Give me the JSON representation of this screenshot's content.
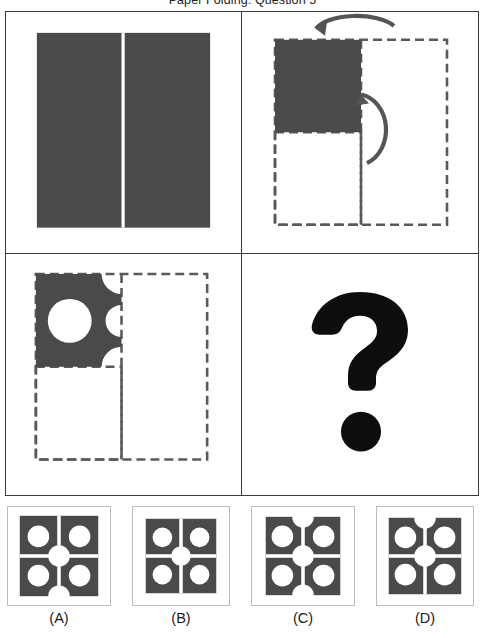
{
  "title": "Paper Folding: Question 5",
  "colors": {
    "paper_dark": "#4a4a4a",
    "paper_dark_alt": "#444444",
    "ink_black": "#0d0d0d",
    "fold_line": "#ffffff",
    "dashed_outline": "#5a5a5a",
    "panel_border": "#3b3b3b",
    "answer_border": "#bdbdbd",
    "background": "#ffffff"
  },
  "panels": [
    {
      "index": 1,
      "name": "unfolded-sheet",
      "description": "Full dark square sheet with a single vertical fold line down the centre",
      "fold_lines": 1,
      "fold_orientation": "vertical",
      "holes": 0
    },
    {
      "index": 2,
      "name": "folding-step",
      "description": "Sheet folded right-half over to the left, then bottom-half up; dark quadrant top-left, dashed outlines show original extents",
      "shaded_quadrant": "top-left",
      "arrows": [
        {
          "name": "fold-arrow-horizontal",
          "from": "right",
          "to": "left",
          "position": "top"
        },
        {
          "name": "fold-arrow-vertical",
          "from": "bottom",
          "to": "top",
          "position": "right"
        }
      ],
      "holes": 0
    },
    {
      "index": 3,
      "name": "punched-sheet",
      "description": "Folded packet with one full circular hole punched through the centre of the dark quadrant and half-circle notches along its right and bottom edges",
      "shaded_quadrant": "top-left",
      "full_holes": 1,
      "edge_notches": 3
    },
    {
      "index": 4,
      "name": "question-panel",
      "description": "Bold black question mark marking the unknown answer",
      "glyph": "?"
    }
  ],
  "answers": [
    {
      "id": "A",
      "label": "(A)",
      "name": "answer-option-a",
      "quadrant_circles": 4,
      "center_circle": true,
      "fold_lines": "cross",
      "edge_notches": [
        "bottom"
      ]
    },
    {
      "id": "B",
      "label": "(B)",
      "name": "answer-option-b",
      "quadrant_circles": 4,
      "center_circle": true,
      "fold_lines": "cross",
      "edge_notches": []
    },
    {
      "id": "C",
      "label": "(C)",
      "name": "answer-option-c",
      "quadrant_circles": 4,
      "center_circle": true,
      "fold_lines": "cross",
      "edge_notches": [
        "top",
        "bottom"
      ]
    },
    {
      "id": "D",
      "label": "(D)",
      "name": "answer-option-d",
      "quadrant_circles": 4,
      "center_circle": true,
      "fold_lines": "cross",
      "edge_notches": [
        "top"
      ]
    }
  ]
}
